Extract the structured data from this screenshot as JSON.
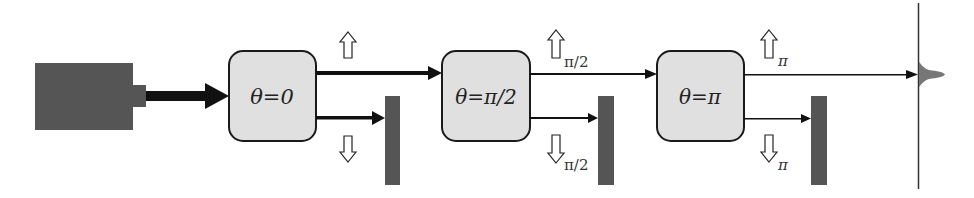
{
  "diagram": {
    "type": "sequential measurement / beam-splitting setup",
    "colors": {
      "source": "#555555",
      "box_fill": "#e0e0e0",
      "box_stroke": "#1a1a1a",
      "detector": "#555555",
      "line": "#111111",
      "screen": "#333333",
      "peak": "#777777"
    },
    "source": {
      "label": ""
    },
    "stages": [
      {
        "box_label": "θ=0",
        "up_label": "",
        "down_label": ""
      },
      {
        "box_label": "θ=π/2",
        "up_label": "π/2",
        "down_label": "π/2"
      },
      {
        "box_label": "θ=π",
        "up_label": "π",
        "down_label": "π"
      }
    ],
    "screen": {
      "label": ""
    }
  }
}
